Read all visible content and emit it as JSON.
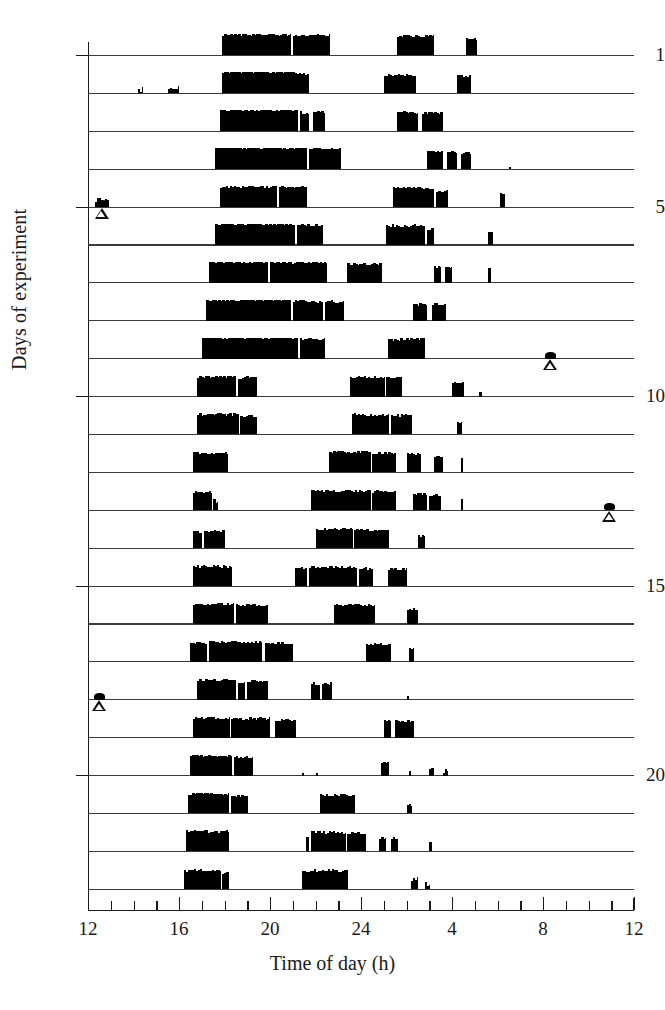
{
  "axes": {
    "y_title": "Days of experiment",
    "x_title": "Time of day (h)",
    "y_tick_labels": [
      "1",
      "5",
      "10",
      "15",
      "20"
    ],
    "x_tick_labels": [
      "12",
      "16",
      "20",
      "24",
      "4",
      "8",
      "12"
    ]
  },
  "chart_data": {
    "type": "bar",
    "subtype": "actogram",
    "title": "",
    "xlabel": "Time of day (h)",
    "ylabel": "Days of experiment",
    "xlim": [
      12,
      36
    ],
    "ylim": [
      1,
      23
    ],
    "x_major_ticks": [
      12,
      16,
      20,
      24,
      28,
      32,
      36
    ],
    "x_major_tick_labels": [
      "12",
      "16",
      "20",
      "24",
      "4",
      "8",
      "12"
    ],
    "x_minor_tick_step": 1,
    "y_ticks": [
      1,
      5,
      10,
      15,
      20
    ],
    "y_tick_labels": [
      "1",
      "5",
      "10",
      "15",
      "20"
    ],
    "grid": false,
    "legend": null,
    "n_days": 23,
    "bar_color": "#000000",
    "baseline_color": "#3a3a3a",
    "marker_color": "#111111",
    "units": {
      "x": "hours of day (12:00 to 12:00 next day)",
      "y": "experiment day number",
      "bar_height": "relative activity counts, 0-1"
    },
    "markers": [
      {
        "day": 5,
        "time": 12.6,
        "type": "open-triangle",
        "with_blot": true
      },
      {
        "day": 9,
        "time": 32.3,
        "type": "open-triangle",
        "with_blot": true
      },
      {
        "day": 13,
        "time": 34.9,
        "type": "open-triangle",
        "with_blot": true
      },
      {
        "day": 18,
        "time": 12.5,
        "type": "open-triangle",
        "with_blot": true
      }
    ],
    "days": [
      {
        "day": 1,
        "bouts": [
          {
            "start": 17.9,
            "end": 20.9,
            "level": 0.95
          },
          {
            "start": 21.0,
            "end": 22.6,
            "level": 0.92
          },
          {
            "start": 25.6,
            "end": 27.2,
            "level": 0.88
          },
          {
            "start": 28.6,
            "end": 29.1,
            "level": 0.75
          }
        ]
      },
      {
        "day": 2,
        "bouts": [
          {
            "start": 14.2,
            "end": 14.4,
            "level": 0.12
          },
          {
            "start": 15.5,
            "end": 16.0,
            "level": 0.22
          },
          {
            "start": 17.9,
            "end": 21.1,
            "level": 0.97
          },
          {
            "start": 21.1,
            "end": 21.7,
            "level": 0.88
          },
          {
            "start": 25.0,
            "end": 26.4,
            "level": 0.82
          },
          {
            "start": 28.2,
            "end": 28.8,
            "level": 0.78
          }
        ]
      },
      {
        "day": 3,
        "bouts": [
          {
            "start": 17.8,
            "end": 21.2,
            "level": 0.96
          },
          {
            "start": 21.3,
            "end": 21.7,
            "level": 0.85
          },
          {
            "start": 21.9,
            "end": 22.4,
            "level": 0.88
          },
          {
            "start": 25.6,
            "end": 26.5,
            "level": 0.85
          },
          {
            "start": 26.7,
            "end": 27.6,
            "level": 0.83
          }
        ]
      },
      {
        "day": 4,
        "bouts": [
          {
            "start": 17.6,
            "end": 21.6,
            "level": 0.97
          },
          {
            "start": 21.7,
            "end": 23.1,
            "level": 0.93
          },
          {
            "start": 26.9,
            "end": 27.6,
            "level": 0.8
          },
          {
            "start": 27.8,
            "end": 28.2,
            "level": 0.76
          },
          {
            "start": 28.4,
            "end": 28.8,
            "level": 0.74
          },
          {
            "start": 30.5,
            "end": 30.6,
            "level": 0.1
          }
        ]
      },
      {
        "day": 5,
        "bouts": [
          {
            "start": 12.3,
            "end": 12.9,
            "level": 0.25
          },
          {
            "start": 17.8,
            "end": 20.3,
            "level": 0.93
          },
          {
            "start": 20.4,
            "end": 21.6,
            "level": 0.9
          },
          {
            "start": 25.4,
            "end": 27.2,
            "level": 0.86
          },
          {
            "start": 27.3,
            "end": 27.8,
            "level": 0.7
          },
          {
            "start": 30.1,
            "end": 30.3,
            "level": 0.55
          }
        ]
      },
      {
        "day": 6,
        "bouts": [
          {
            "start": 17.6,
            "end": 21.1,
            "level": 0.96
          },
          {
            "start": 21.2,
            "end": 22.3,
            "level": 0.9
          },
          {
            "start": 25.1,
            "end": 26.8,
            "level": 0.88
          },
          {
            "start": 26.9,
            "end": 27.2,
            "level": 0.7
          },
          {
            "start": 29.6,
            "end": 29.8,
            "level": 0.6
          }
        ]
      },
      {
        "day": 7,
        "bouts": [
          {
            "start": 17.3,
            "end": 19.9,
            "level": 0.95
          },
          {
            "start": 20.0,
            "end": 22.5,
            "level": 0.93
          },
          {
            "start": 23.4,
            "end": 24.9,
            "level": 0.85
          },
          {
            "start": 27.2,
            "end": 27.5,
            "level": 0.72
          },
          {
            "start": 27.7,
            "end": 28.0,
            "level": 0.72
          },
          {
            "start": 29.6,
            "end": 29.7,
            "level": 0.7
          }
        ]
      },
      {
        "day": 8,
        "bouts": [
          {
            "start": 17.2,
            "end": 20.9,
            "level": 0.95
          },
          {
            "start": 21.0,
            "end": 22.3,
            "level": 0.88
          },
          {
            "start": 22.4,
            "end": 23.2,
            "level": 0.86
          },
          {
            "start": 26.3,
            "end": 26.9,
            "level": 0.72
          },
          {
            "start": 27.1,
            "end": 27.7,
            "level": 0.74
          }
        ]
      },
      {
        "day": 9,
        "bouts": [
          {
            "start": 17.0,
            "end": 21.2,
            "level": 0.96
          },
          {
            "start": 21.3,
            "end": 22.4,
            "level": 0.9
          },
          {
            "start": 25.2,
            "end": 26.8,
            "level": 0.87
          }
        ]
      },
      {
        "day": 10,
        "bouts": [
          {
            "start": 16.8,
            "end": 18.5,
            "level": 0.9
          },
          {
            "start": 18.6,
            "end": 19.4,
            "level": 0.85
          },
          {
            "start": 23.5,
            "end": 25.0,
            "level": 0.88
          },
          {
            "start": 25.1,
            "end": 25.8,
            "level": 0.83
          },
          {
            "start": 28.0,
            "end": 28.5,
            "level": 0.62
          },
          {
            "start": 29.2,
            "end": 29.3,
            "level": 0.22
          }
        ]
      },
      {
        "day": 11,
        "bouts": [
          {
            "start": 16.8,
            "end": 18.6,
            "level": 0.9
          },
          {
            "start": 18.7,
            "end": 19.4,
            "level": 0.83
          },
          {
            "start": 23.6,
            "end": 25.2,
            "level": 0.9
          },
          {
            "start": 25.3,
            "end": 26.2,
            "level": 0.86
          },
          {
            "start": 28.2,
            "end": 28.4,
            "level": 0.5
          }
        ]
      },
      {
        "day": 12,
        "bouts": [
          {
            "start": 16.6,
            "end": 18.1,
            "level": 0.88
          },
          {
            "start": 22.6,
            "end": 24.4,
            "level": 0.92
          },
          {
            "start": 24.5,
            "end": 25.5,
            "level": 0.88
          },
          {
            "start": 26.0,
            "end": 26.6,
            "level": 0.8
          },
          {
            "start": 27.2,
            "end": 27.6,
            "level": 0.72
          },
          {
            "start": 28.4,
            "end": 28.5,
            "level": 0.68
          }
        ]
      },
      {
        "day": 13,
        "bouts": [
          {
            "start": 16.6,
            "end": 17.4,
            "level": 0.82
          },
          {
            "start": 17.5,
            "end": 17.7,
            "level": 0.38
          },
          {
            "start": 21.8,
            "end": 24.4,
            "level": 0.88
          },
          {
            "start": 24.5,
            "end": 25.5,
            "level": 0.84
          },
          {
            "start": 26.3,
            "end": 26.9,
            "level": 0.72
          },
          {
            "start": 27.0,
            "end": 27.5,
            "level": 0.68
          },
          {
            "start": 28.4,
            "end": 28.5,
            "level": 0.52
          }
        ]
      },
      {
        "day": 14,
        "bouts": [
          {
            "start": 16.6,
            "end": 17.0,
            "level": 0.72
          },
          {
            "start": 17.1,
            "end": 18.0,
            "level": 0.76
          },
          {
            "start": 22.0,
            "end": 23.6,
            "level": 0.86
          },
          {
            "start": 23.7,
            "end": 25.2,
            "level": 0.82
          },
          {
            "start": 26.5,
            "end": 26.8,
            "level": 0.55
          }
        ]
      },
      {
        "day": 15,
        "bouts": [
          {
            "start": 16.6,
            "end": 18.3,
            "level": 0.88
          },
          {
            "start": 21.1,
            "end": 21.6,
            "level": 0.8
          },
          {
            "start": 21.7,
            "end": 23.8,
            "level": 0.86
          },
          {
            "start": 23.9,
            "end": 24.5,
            "level": 0.8
          },
          {
            "start": 25.2,
            "end": 26.0,
            "level": 0.76
          }
        ]
      },
      {
        "day": 16,
        "bouts": [
          {
            "start": 16.6,
            "end": 18.4,
            "level": 0.9
          },
          {
            "start": 18.5,
            "end": 19.9,
            "level": 0.86
          },
          {
            "start": 22.8,
            "end": 24.6,
            "level": 0.86
          },
          {
            "start": 26.0,
            "end": 26.5,
            "level": 0.66
          }
        ]
      },
      {
        "day": 17,
        "bouts": [
          {
            "start": 16.5,
            "end": 17.2,
            "level": 0.85
          },
          {
            "start": 17.3,
            "end": 19.6,
            "level": 0.9
          },
          {
            "start": 19.8,
            "end": 21.0,
            "level": 0.84
          },
          {
            "start": 24.2,
            "end": 25.3,
            "level": 0.8
          },
          {
            "start": 26.1,
            "end": 26.3,
            "level": 0.62
          }
        ]
      },
      {
        "day": 18,
        "bouts": [
          {
            "start": 16.8,
            "end": 18.5,
            "level": 0.88
          },
          {
            "start": 18.6,
            "end": 18.9,
            "level": 0.8
          },
          {
            "start": 19.0,
            "end": 19.9,
            "level": 0.86
          },
          {
            "start": 21.8,
            "end": 22.2,
            "level": 0.72
          },
          {
            "start": 22.3,
            "end": 22.7,
            "level": 0.74
          },
          {
            "start": 26.0,
            "end": 26.1,
            "level": 0.18
          }
        ]
      },
      {
        "day": 19,
        "bouts": [
          {
            "start": 16.6,
            "end": 18.2,
            "level": 0.88
          },
          {
            "start": 18.3,
            "end": 20.0,
            "level": 0.86
          },
          {
            "start": 20.2,
            "end": 21.1,
            "level": 0.8
          },
          {
            "start": 25.0,
            "end": 25.3,
            "level": 0.72
          },
          {
            "start": 25.5,
            "end": 26.3,
            "level": 0.76
          }
        ]
      },
      {
        "day": 20,
        "bouts": [
          {
            "start": 16.5,
            "end": 18.3,
            "level": 0.88
          },
          {
            "start": 18.4,
            "end": 19.2,
            "level": 0.84
          },
          {
            "start": 21.4,
            "end": 21.5,
            "level": 0.12
          },
          {
            "start": 22.0,
            "end": 22.1,
            "level": 0.12
          },
          {
            "start": 24.9,
            "end": 25.2,
            "level": 0.55
          },
          {
            "start": 26.1,
            "end": 26.2,
            "level": 0.22
          },
          {
            "start": 27.0,
            "end": 27.2,
            "level": 0.18
          },
          {
            "start": 27.6,
            "end": 27.8,
            "level": 0.18
          }
        ]
      },
      {
        "day": 21,
        "bouts": [
          {
            "start": 16.4,
            "end": 18.2,
            "level": 0.88
          },
          {
            "start": 18.3,
            "end": 19.0,
            "level": 0.8
          },
          {
            "start": 22.2,
            "end": 23.7,
            "level": 0.84
          },
          {
            "start": 26.0,
            "end": 26.2,
            "level": 0.4
          }
        ]
      },
      {
        "day": 22,
        "bouts": [
          {
            "start": 16.3,
            "end": 18.2,
            "level": 0.9
          },
          {
            "start": 21.6,
            "end": 21.7,
            "level": 0.7
          },
          {
            "start": 21.8,
            "end": 23.3,
            "level": 0.86
          },
          {
            "start": 23.4,
            "end": 24.2,
            "level": 0.82
          },
          {
            "start": 24.8,
            "end": 25.1,
            "level": 0.58
          },
          {
            "start": 25.3,
            "end": 25.6,
            "level": 0.58
          },
          {
            "start": 27.0,
            "end": 27.1,
            "level": 0.45
          }
        ]
      },
      {
        "day": 23,
        "bouts": [
          {
            "start": 16.2,
            "end": 17.8,
            "level": 0.86
          },
          {
            "start": 17.9,
            "end": 18.2,
            "level": 0.72
          },
          {
            "start": 21.4,
            "end": 23.4,
            "level": 0.84
          },
          {
            "start": 26.2,
            "end": 26.5,
            "level": 0.4
          },
          {
            "start": 26.8,
            "end": 27.0,
            "level": 0.22
          }
        ]
      }
    ]
  }
}
